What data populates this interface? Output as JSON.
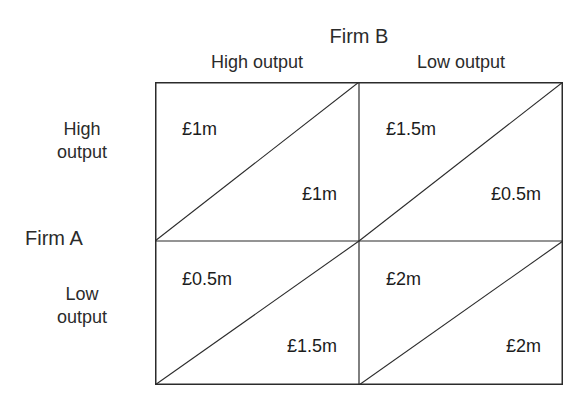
{
  "diagram": {
    "type": "payoff-matrix",
    "column_player": {
      "name": "Firm B",
      "strategies": [
        "High output",
        "Low output"
      ]
    },
    "row_player": {
      "name": "Firm A",
      "strategies": [
        "High\noutput",
        "Low\noutput"
      ],
      "strategy_lines": [
        [
          "High",
          "output"
        ],
        [
          "Low",
          "output"
        ]
      ]
    },
    "cells": [
      {
        "row": "High output",
        "col": "High output",
        "row_payoff": "£1m",
        "col_payoff": "£1m"
      },
      {
        "row": "High output",
        "col": "Low output",
        "row_payoff": "£1.5m",
        "col_payoff": "£0.5m"
      },
      {
        "row": "Low output",
        "col": "High output",
        "row_payoff": "£0.5m",
        "col_payoff": "£1.5m"
      },
      {
        "row": "Low output",
        "col": "Low output",
        "row_payoff": "£2m",
        "col_payoff": "£2m"
      }
    ],
    "colors": {
      "line": "#2b2b2b",
      "text": "#1c1c1c",
      "background": "#ffffff"
    }
  }
}
